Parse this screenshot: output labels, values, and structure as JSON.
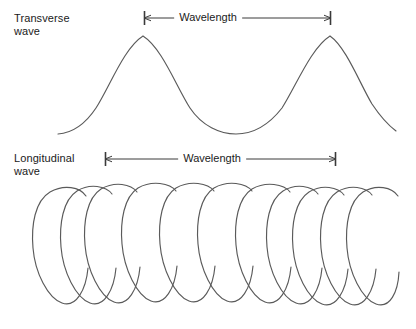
{
  "figure": {
    "type": "diagram",
    "background_color": "#ffffff",
    "stroke_color": "#5a5a5a",
    "text_color": "#1a1a1a"
  },
  "panels": [
    {
      "id": "transverse",
      "label": "Transverse\nwave",
      "wave_kind": "transverse",
      "dimension": {
        "caption": "Wavelength",
        "arrow_style": "double-ended",
        "x_start": 144,
        "x_end": 331,
        "y": 18,
        "measures": "crest to crest"
      },
      "wave_geometry": {
        "x_start": 58,
        "x_end": 396,
        "crest_y": 36,
        "trough_y": 134,
        "crests_x": [
          143,
          330
        ],
        "troughs_x": [
          236
        ],
        "wavelength_px": 187
      }
    },
    {
      "id": "longitudinal",
      "label": "Longitudinal\nwave",
      "wave_kind": "longitudinal",
      "dimension": {
        "caption": "Wavelength",
        "arrow_style": "double-ended",
        "x_start": 105,
        "x_end": 336,
        "y": 159,
        "measures": "compression to compression"
      },
      "coil_geometry": {
        "x_start": 33,
        "x_end": 398,
        "top_y": 186,
        "bottom_y": 305,
        "loop_count": 9,
        "loop_centers_x": [
          57,
          86,
          110,
          140,
          175,
          211,
          248,
          283,
          310,
          335,
          362
        ],
        "description": "helical spring with alternating compressions and rarefactions"
      }
    }
  ]
}
